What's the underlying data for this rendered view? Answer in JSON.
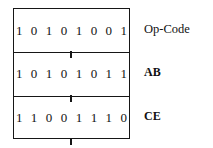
{
  "diagram": {
    "colors": {
      "border": "#161616",
      "text": "#111111",
      "background": "#ffffff"
    },
    "rows": [
      {
        "bits": "1 0 1 0 1 0 0 1",
        "bits_plain": "10101001",
        "label": "Op-Code",
        "label_bold": false,
        "tick": true
      },
      {
        "bits": "1 0 1 0 1 0 1 1",
        "bits_plain": "10101011",
        "label": "AB",
        "label_bold": true,
        "tick": true
      },
      {
        "bits": "1 1 0 0 1 1 1 0",
        "bits_plain": "11001110",
        "label": "CE",
        "label_bold": true,
        "tick": true
      }
    ]
  }
}
